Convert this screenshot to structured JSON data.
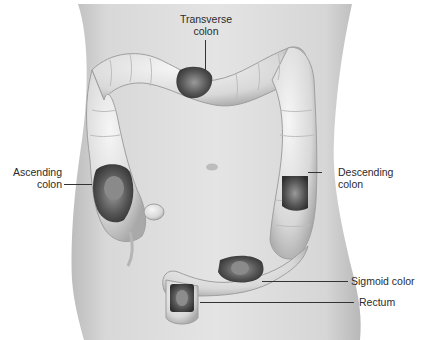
{
  "figure": {
    "background_color": "#ffffff",
    "body_tone": "#d9d9d9",
    "colon_tone": "#e6e6e6",
    "lesion_tone": "#4a4a4a"
  },
  "labels": {
    "transverse": {
      "line1": "Transverse",
      "line2": "colon"
    },
    "ascending": {
      "line1": "Ascending",
      "line2": "colon"
    },
    "descending": {
      "line1": "Descending",
      "line2": "colon"
    },
    "sigmoid": {
      "text": "Sigmoid color"
    },
    "rectum": {
      "text": "Rectum"
    }
  }
}
